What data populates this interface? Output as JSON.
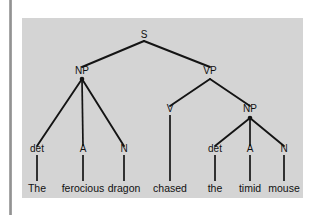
{
  "figure": {
    "kind": "syntax-parse-tree",
    "sentence": "The ferocious dragon chased the timid mouse",
    "panel_background": "#d4d4d4",
    "line_color": "#141414",
    "text_color": "#111111",
    "nodes": {
      "s": "S",
      "np_subject": "NP",
      "vp": "VP",
      "v": "V",
      "np_object": "NP",
      "det1": "det",
      "a1": "A",
      "n1": "N",
      "det2": "det",
      "a2": "A",
      "n2": "N"
    },
    "leaves": {
      "w1": "The",
      "w2": "ferocious",
      "w3": "dragon",
      "w4": "chased",
      "w5": "the",
      "w6": "timid",
      "w7": "mouse"
    }
  }
}
